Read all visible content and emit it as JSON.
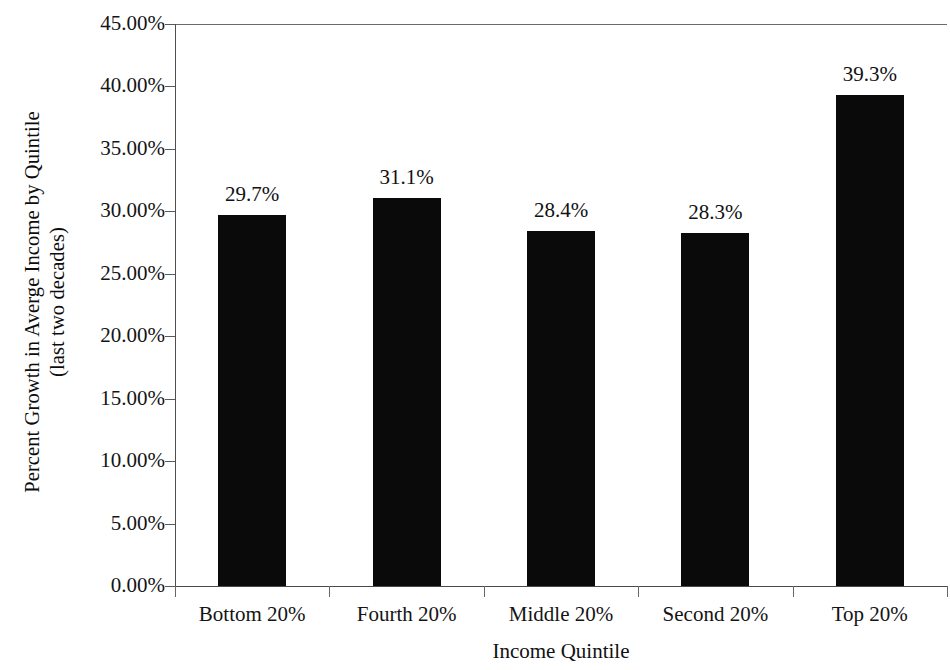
{
  "chart_data": {
    "type": "bar",
    "title": "",
    "subtitle": "",
    "categories": [
      "Bottom 20%",
      "Fourth 20%",
      "Middle 20%",
      "Second 20%",
      "Top 20%"
    ],
    "values": [
      29.7,
      31.1,
      28.4,
      28.3,
      39.3
    ],
    "data_labels": [
      "29.7%",
      "31.1%",
      "28.4%",
      "28.3%",
      "39.3%"
    ],
    "xlabel": "Income Quintile",
    "ylabel": "Percent Growth in Averge Income by Quintile (last two decades)",
    "ylabel_line1": "Percent Growth in Averge Income by Quintile",
    "ylabel_line2": "(last two decades)",
    "ylim": [
      0,
      45
    ],
    "ytick_values": [
      0,
      5,
      10,
      15,
      20,
      25,
      30,
      35,
      40,
      45
    ],
    "ytick_labels": [
      "0.00%",
      "5.00%",
      "10.00%",
      "15.00%",
      "20.00%",
      "25.00%",
      "30.00%",
      "35.00%",
      "40.00%",
      "45.00%"
    ],
    "grid": false,
    "legend": "none",
    "bar_color": "#0a0a0a",
    "axis_color": "#4f4f4f",
    "background": "#ffffff"
  }
}
